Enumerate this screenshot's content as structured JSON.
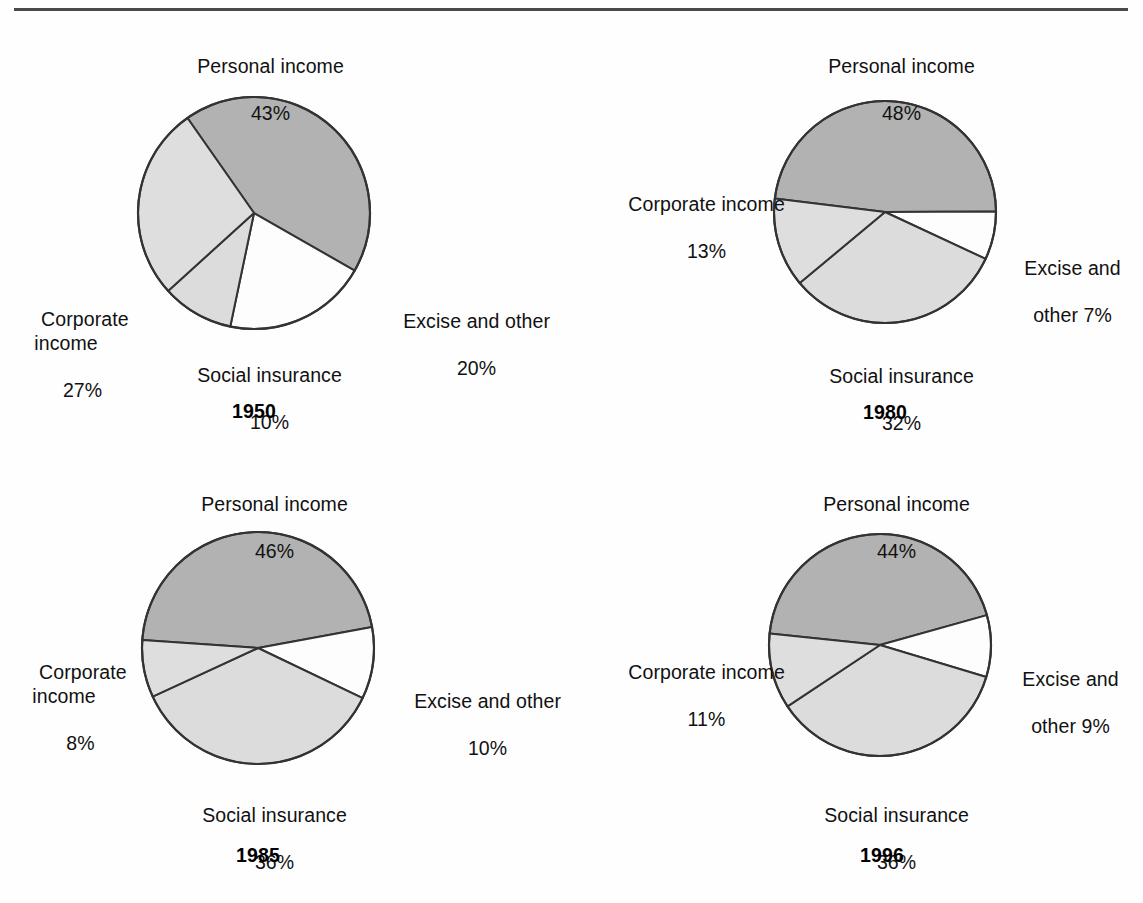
{
  "figure": {
    "background_color": "#fefefe",
    "rule_color": "#4a4a4a",
    "outline_color": "#333333"
  },
  "palette": {
    "personal_income": "#b2b2b2",
    "corporate_income": "#dedede",
    "social_insurance": "#dcdcdc",
    "excise_and_other": "#fdfdfd"
  },
  "charts": [
    {
      "id": "pie-1950",
      "year": "1950",
      "labels": {
        "personal": {
          "name": "Personal income",
          "value": "43%"
        },
        "corporate": {
          "name": "Corporate\nincome",
          "value": "27%"
        },
        "social": {
          "name": "Social insurance",
          "value": "10%"
        },
        "excise": {
          "name": "Excise and other",
          "value": "20%"
        }
      }
    },
    {
      "id": "pie-1980",
      "year": "1980",
      "labels": {
        "personal": {
          "name": "Personal income",
          "value": "48%"
        },
        "corporate": {
          "name": "Corporate income",
          "value": "13%"
        },
        "social": {
          "name": "Social insurance",
          "value": "32%"
        },
        "excise": {
          "name": "Excise and",
          "value": "other 7%"
        }
      }
    },
    {
      "id": "pie-1985",
      "year": "1985",
      "labels": {
        "personal": {
          "name": "Personal income",
          "value": "46%"
        },
        "corporate": {
          "name": "Corporate\nincome",
          "value": "8%"
        },
        "social": {
          "name": "Social insurance",
          "value": "36%"
        },
        "excise": {
          "name": "Excise and other",
          "value": "10%"
        }
      }
    },
    {
      "id": "pie-1996",
      "year": "1996",
      "labels": {
        "personal": {
          "name": "Personal income",
          "value": "44%"
        },
        "corporate": {
          "name": "Corporate income",
          "value": "11%"
        },
        "social": {
          "name": "Social insurance",
          "value": "36%"
        },
        "excise": {
          "name": "Excise and",
          "value": "other 9%"
        }
      }
    }
  ],
  "chart_data": [
    {
      "type": "pie",
      "title": "1950",
      "categories": [
        "Personal income",
        "Corporate income",
        "Social insurance",
        "Excise and other"
      ],
      "values": [
        43,
        27,
        10,
        20
      ],
      "unit": "percent",
      "colors": [
        "#b2b2b2",
        "#dedede",
        "#dcdcdc",
        "#fdfdfd"
      ],
      "start_angle_deg": -35,
      "direction": "clockwise",
      "legend": "labels outside slices",
      "center": [
        254,
        213
      ],
      "radius": 115
    },
    {
      "type": "pie",
      "title": "1980",
      "categories": [
        "Personal income",
        "Corporate income",
        "Social insurance",
        "Excise and other"
      ],
      "values": [
        48,
        13,
        32,
        7
      ],
      "unit": "percent",
      "colors": [
        "#b2b2b2",
        "#dedede",
        "#dcdcdc",
        "#fdfdfd"
      ],
      "start_angle_deg": -83,
      "direction": "clockwise",
      "legend": "labels outside slices",
      "center": [
        885,
        212
      ],
      "radius": 110
    },
    {
      "type": "pie",
      "title": "1985",
      "categories": [
        "Personal income",
        "Corporate income",
        "Social insurance",
        "Excise and other"
      ],
      "values": [
        46,
        8,
        36,
        10
      ],
      "unit": "percent",
      "colors": [
        "#b2b2b2",
        "#dedede",
        "#dcdcdc",
        "#fdfdfd"
      ],
      "start_angle_deg": -86,
      "direction": "clockwise",
      "legend": "labels outside slices",
      "center": [
        258,
        648
      ],
      "radius": 115
    },
    {
      "type": "pie",
      "title": "1996",
      "categories": [
        "Personal income",
        "Corporate income",
        "Social insurance",
        "Excise and other"
      ],
      "values": [
        44,
        11,
        36,
        9
      ],
      "unit": "percent",
      "colors": [
        "#b2b2b2",
        "#dedede",
        "#dcdcdc",
        "#fdfdfd"
      ],
      "start_angle_deg": -84,
      "direction": "clockwise",
      "legend": "labels outside slices",
      "center": [
        880,
        645
      ],
      "radius": 110
    }
  ]
}
